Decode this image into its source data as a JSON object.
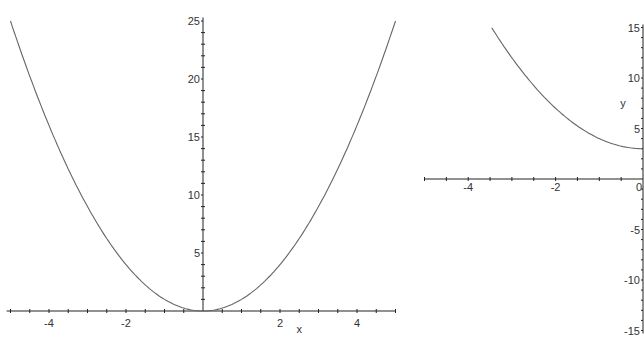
{
  "chart_data": [
    {
      "type": "line",
      "title": "",
      "xlabel": "x",
      "ylabel": "",
      "function": "y = x^2",
      "xlim": [
        -5,
        5
      ],
      "ylim": [
        0,
        25
      ],
      "x_ticks": [
        "-4",
        "-2",
        "2",
        "4"
      ],
      "y_ticks": [
        "5",
        "10",
        "15",
        "20",
        "25"
      ],
      "series": [
        {
          "name": "x^2",
          "x": [
            -5,
            -4,
            -3,
            -2,
            -1,
            0,
            1,
            2,
            3,
            4,
            5
          ],
          "values": [
            25,
            16,
            9,
            4,
            1,
            0,
            1,
            4,
            9,
            16,
            25
          ]
        }
      ],
      "grid": false
    },
    {
      "type": "line",
      "title": "",
      "xlabel": "",
      "ylabel": "y",
      "function": "y = x^2 + 3",
      "xlim": [
        -5,
        0
      ],
      "ylim": [
        -15,
        15
      ],
      "x_ticks": [
        "-4",
        "-2",
        "0"
      ],
      "y_ticks": [
        "15",
        "10",
        "5",
        "-5",
        "-10",
        "-15"
      ],
      "series": [
        {
          "name": "x^2+3",
          "x": [
            -3.46,
            -3,
            -2,
            -1,
            0
          ],
          "values": [
            15,
            12,
            7,
            4,
            3
          ]
        }
      ],
      "grid": false
    }
  ],
  "plot1": {
    "xlabel": "x",
    "xticks": [
      "-4",
      "-2",
      "2",
      "4"
    ],
    "yticks": [
      "5",
      "10",
      "15",
      "20",
      "25"
    ]
  },
  "plot2": {
    "ylabel": "y",
    "xticks": [
      "-4",
      "-2",
      "0"
    ],
    "yticks": [
      "15",
      "10",
      "5",
      "-5",
      "-10",
      "-15"
    ]
  }
}
